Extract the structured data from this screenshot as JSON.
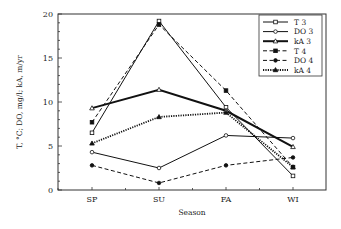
{
  "chart_data": {
    "type": "line",
    "title": "",
    "xlabel": "Season",
    "ylabel": "T, °C; DO, mg/l; kA, m/yr",
    "categories": [
      "SP",
      "SU",
      "FA",
      "WI"
    ],
    "ylim": [
      0,
      20
    ],
    "yticks": [
      0,
      5,
      10,
      15,
      20
    ],
    "grid": false,
    "legend_position": "upper right",
    "series": [
      {
        "name": "T 3",
        "values": [
          6.5,
          19.2,
          9.4,
          1.6
        ],
        "line": "solid",
        "width": 1,
        "marker": "open-square"
      },
      {
        "name": "DO 3",
        "values": [
          4.3,
          2.5,
          6.2,
          5.9
        ],
        "line": "solid",
        "width": 1,
        "marker": "open-circle"
      },
      {
        "name": "kA 3",
        "values": [
          9.3,
          11.4,
          9.0,
          4.9
        ],
        "line": "solid",
        "width": 2,
        "marker": "open-triangle"
      },
      {
        "name": "T 4",
        "values": [
          7.7,
          18.8,
          11.3,
          2.6
        ],
        "line": "dashed",
        "width": 1,
        "marker": "filled-square"
      },
      {
        "name": "DO 4",
        "values": [
          2.8,
          0.8,
          2.8,
          3.7
        ],
        "line": "dashed",
        "width": 1,
        "marker": "filled-circle"
      },
      {
        "name": "kA 4",
        "values": [
          5.3,
          8.3,
          8.8,
          2.6
        ],
        "line": "dotted",
        "width": 1.8,
        "marker": "filled-triangle"
      }
    ]
  }
}
